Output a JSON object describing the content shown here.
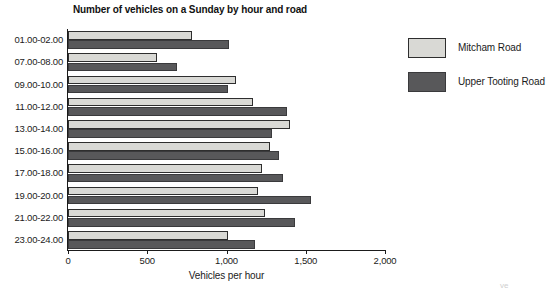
{
  "chart_data": {
    "type": "bar",
    "orientation": "horizontal",
    "title": "Number of vehicles on a Sunday by hour and road",
    "xlabel": "Vehicles per hour",
    "ylabel": "",
    "xlim": [
      0,
      2000
    ],
    "xticks": [
      0,
      500,
      1000,
      1500,
      2000
    ],
    "xtick_labels": [
      "0",
      "500",
      "1,000",
      "1,500",
      "2,000"
    ],
    "grid": false,
    "legend_position": "right",
    "categories": [
      "01.00-02.00",
      "07.00-08.00",
      "09.00-10.00",
      "11.00-12.00",
      "13.00-14.00",
      "15.00-16.00",
      "17.00-18.00",
      "19.00-20.00",
      "21.00-22.00",
      "23.00-24.00"
    ],
    "series": [
      {
        "name": "Mitcham Road",
        "color": "#d9d9d5",
        "values": [
          780,
          560,
          1060,
          1165,
          1400,
          1275,
          1225,
          1200,
          1245,
          1010
        ]
      },
      {
        "name": "Upper Tooting Road",
        "color": "#58585a",
        "values": [
          1015,
          690,
          1010,
          1380,
          1290,
          1330,
          1355,
          1530,
          1430,
          1180
        ]
      }
    ]
  },
  "legend": {
    "items": [
      {
        "label": "Mitcham Road",
        "swatch": "light"
      },
      {
        "label": "Upper Tooting Road",
        "swatch": "dark"
      }
    ]
  },
  "artifacts": [
    {
      "text": "ve",
      "left": 500,
      "top": 0
    }
  ]
}
